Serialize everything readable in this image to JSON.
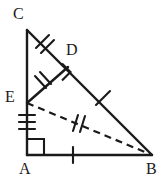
{
  "figure": {
    "background_color": "#ffffff",
    "ink_color": "#1a1a1a",
    "width": 164,
    "height": 181,
    "labels": {
      "c": "C",
      "d": "D",
      "e": "E",
      "a": "A",
      "b": "B"
    },
    "points": {
      "A": {
        "x": 27,
        "y": 155
      },
      "B": {
        "x": 152,
        "y": 155
      },
      "C": {
        "x": 27,
        "y": 30
      },
      "D": {
        "x": 68,
        "y": 67
      },
      "E": {
        "x": 27,
        "y": 103
      }
    },
    "segments": [
      {
        "name": "CA",
        "from": "C",
        "to": "A",
        "style": "solid"
      },
      {
        "name": "AB",
        "from": "A",
        "to": "B",
        "style": "solid"
      },
      {
        "name": "CB",
        "from": "C",
        "to": "B",
        "style": "solid"
      },
      {
        "name": "ED",
        "from": "E",
        "to": "D",
        "style": "solid"
      },
      {
        "name": "EB",
        "from": "E",
        "to": "B",
        "style": "dashed"
      }
    ],
    "tick_marks": [
      {
        "segment": "CD",
        "count": 2
      },
      {
        "segment": "DE",
        "count": 2
      },
      {
        "segment": "EA",
        "count": 3
      },
      {
        "segment": "AB",
        "count": 1
      },
      {
        "segment": "DB",
        "count": 1
      },
      {
        "segment": "EB",
        "count": 2
      }
    ],
    "right_angles": [
      {
        "at": "A",
        "between": [
          "AC",
          "AB"
        ]
      },
      {
        "at": "D",
        "between": [
          "DE",
          "DB"
        ]
      }
    ]
  }
}
